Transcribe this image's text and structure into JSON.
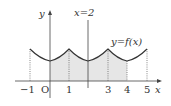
{
  "diagram": {
    "axes": {
      "x_label": "x",
      "y_label": "y",
      "origin_label": "O"
    },
    "x_ticks": [
      "−1",
      "1",
      "3",
      "4",
      "5"
    ],
    "vertical_line_label": "x=2",
    "curve_label": "y=f(x)",
    "shaded_region": {
      "from": 0,
      "to": 4
    },
    "colors": {
      "curve": "#333333",
      "shade": "#e6e6e6",
      "axis": "#444444"
    }
  }
}
